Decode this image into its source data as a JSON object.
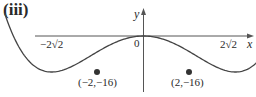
{
  "part_label": "(iii)",
  "chart_data": {
    "type": "line",
    "title": "",
    "function": "y = x^4 - 8x^2",
    "xlabel": "x",
    "ylabel": "y",
    "origin_label": "0",
    "x_intercepts": [
      {
        "label": "−2√2",
        "x": -2.828,
        "y": 0
      },
      {
        "label": "0",
        "x": 0,
        "y": 0
      },
      {
        "label": "2√2",
        "x": 2.828,
        "y": 0
      }
    ],
    "points": [
      {
        "label": "(−2,−16)",
        "x": -2,
        "y": -16
      },
      {
        "label": "(2,−16)",
        "x": 2,
        "y": -16
      }
    ],
    "x": [
      -3.1,
      -2.828,
      -2.5,
      -2,
      -1.5,
      -1,
      -0.5,
      0,
      0.5,
      1,
      1.5,
      2,
      2.5,
      2.828,
      3.1
    ],
    "values": [
      15.4,
      0,
      -10.94,
      -16,
      -12.94,
      -7,
      -1.94,
      0,
      -1.94,
      -7,
      -12.94,
      -16,
      -10.94,
      0,
      15.4
    ],
    "grid": false,
    "legend": "none"
  }
}
